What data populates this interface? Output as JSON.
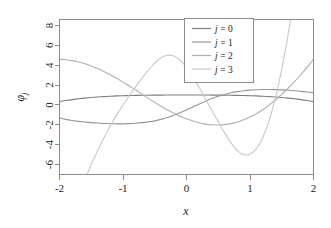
{
  "chart_data": {
    "type": "line",
    "title": "",
    "xlabel": "x",
    "ylabel": "φⱼ",
    "ylabel_base": "φ",
    "ylabel_sub": "j",
    "xlim": [
      -2,
      2
    ],
    "ylim": [
      -7.0,
      8.6
    ],
    "grid": false,
    "legend_position": "top-right-inside",
    "x_ticks": [
      "-2",
      "-1",
      "0",
      "1",
      "2"
    ],
    "x_tick_values": [
      -2,
      -1,
      0,
      1,
      2
    ],
    "y_ticks": [
      "8",
      "6",
      "4",
      "2",
      "0",
      "-2",
      "-4",
      "-6"
    ],
    "y_tick_values": [
      8,
      6,
      4,
      2,
      0,
      -2,
      -4,
      -6
    ],
    "x": [
      -2.0,
      -1.9,
      -1.8,
      -1.7,
      -1.6,
      -1.5,
      -1.4,
      -1.3,
      -1.2,
      -1.1,
      -1.0,
      -0.9,
      -0.8,
      -0.7,
      -0.6,
      -0.5,
      -0.4,
      -0.3,
      -0.2,
      -0.1,
      0.0,
      0.1,
      0.2,
      0.3,
      0.4,
      0.5,
      0.6,
      0.7,
      0.8,
      0.9,
      1.0,
      1.1,
      1.2,
      1.3,
      1.4,
      1.5,
      1.6,
      1.7,
      1.8,
      1.9,
      2.0
    ],
    "series": [
      {
        "name": "j = 0",
        "label_var": "j",
        "label_value": "0",
        "color": "#7d7d7d",
        "values": [
          0.35,
          0.45,
          0.54,
          0.62,
          0.69,
          0.75,
          0.8,
          0.84,
          0.88,
          0.91,
          0.93,
          0.95,
          0.96,
          0.97,
          0.98,
          0.99,
          0.99,
          1.0,
          1.0,
          1.0,
          1.0,
          1.0,
          1.0,
          1.0,
          0.99,
          0.99,
          0.98,
          0.97,
          0.96,
          0.95,
          0.93,
          0.91,
          0.88,
          0.84,
          0.8,
          0.75,
          0.69,
          0.62,
          0.54,
          0.45,
          0.35
        ]
      },
      {
        "name": "j = 1",
        "label_var": "j",
        "label_value": "1",
        "color": "#969696",
        "values": [
          -1.3,
          -1.45,
          -1.56,
          -1.65,
          -1.72,
          -1.78,
          -1.82,
          -1.86,
          -1.88,
          -1.9,
          -1.9,
          -1.88,
          -1.84,
          -1.78,
          -1.7,
          -1.6,
          -1.45,
          -1.26,
          -1.04,
          -0.78,
          -0.5,
          -0.2,
          0.1,
          0.38,
          0.64,
          0.87,
          1.06,
          1.22,
          1.34,
          1.43,
          1.49,
          1.53,
          1.55,
          1.55,
          1.54,
          1.52,
          1.48,
          1.43,
          1.37,
          1.3,
          1.22
        ]
      },
      {
        "name": "j = 2",
        "label_var": "j",
        "label_value": "2",
        "color": "#b0b0b0",
        "values": [
          4.6,
          4.55,
          4.46,
          4.32,
          4.14,
          3.92,
          3.66,
          3.36,
          3.03,
          2.68,
          2.3,
          1.9,
          1.5,
          1.08,
          0.66,
          0.25,
          -0.14,
          -0.5,
          -0.84,
          -1.13,
          -1.4,
          -1.62,
          -1.8,
          -1.93,
          -2.0,
          -2.02,
          -1.98,
          -1.88,
          -1.72,
          -1.5,
          -1.22,
          -0.88,
          -0.48,
          -0.02,
          0.5,
          1.06,
          1.68,
          2.34,
          3.04,
          3.8,
          4.6
        ]
      },
      {
        "name": "j = 3",
        "label_var": "j",
        "label_value": "3",
        "color": "#c8c8c8",
        "values": [
          -14.5,
          -12.6,
          -10.8,
          -9.1,
          -7.5,
          -6.0,
          -4.6,
          -3.3,
          -2.1,
          -1.0,
          0.0,
          0.95,
          1.85,
          2.7,
          3.5,
          4.22,
          4.75,
          5.0,
          4.92,
          4.5,
          3.8,
          2.85,
          1.75,
          0.6,
          -0.55,
          -1.7,
          -2.8,
          -3.8,
          -4.6,
          -5.0,
          -4.95,
          -4.4,
          -3.3,
          -1.6,
          0.7,
          3.6,
          7.1,
          11.2,
          15.9,
          21.2,
          27.0
        ]
      }
    ]
  },
  "axes": {
    "x_axis_name": "x-axis",
    "y_axis_name": "y-axis"
  },
  "legend": {
    "entries": [
      {
        "label": "j = 0",
        "var": "j",
        "eq": "=",
        "value": "0"
      },
      {
        "label": "j = 1",
        "var": "j",
        "eq": "=",
        "value": "1"
      },
      {
        "label": "j = 2",
        "var": "j",
        "eq": "=",
        "value": "2"
      },
      {
        "label": "j = 3",
        "var": "j",
        "eq": "=",
        "value": "3"
      }
    ]
  },
  "colors": {
    "background": "#ffffff",
    "axis": "#8c8c8c",
    "text": "#232323"
  }
}
